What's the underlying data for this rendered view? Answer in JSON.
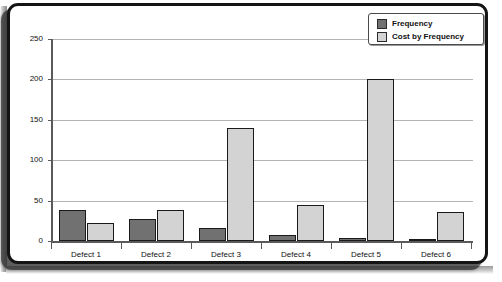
{
  "chart_data": {
    "type": "bar",
    "title": "",
    "subtitle": "",
    "xlabel": "",
    "ylabel": "",
    "categories": [
      "Defect 1",
      "Defect 2",
      "Defect 3",
      "Defect 4",
      "Defect 5",
      "Defect 6"
    ],
    "series": [
      {
        "name": "Frequency",
        "color": "#717171",
        "values": [
          38,
          27,
          16,
          8,
          4,
          3
        ]
      },
      {
        "name": "Cost by Frequency",
        "color": "#d3d3d3",
        "values": [
          22,
          39,
          140,
          45,
          200,
          36
        ]
      }
    ],
    "ylim": [
      0,
      250
    ],
    "yticks": [
      0,
      50,
      100,
      150,
      200,
      250
    ],
    "ytick_labels": [
      "0",
      "50",
      "100",
      "150",
      "200",
      "250"
    ],
    "grid": true,
    "legend_position": "top-right",
    "legend_entries": [
      "Frequency",
      "Cost by Frequency"
    ]
  }
}
